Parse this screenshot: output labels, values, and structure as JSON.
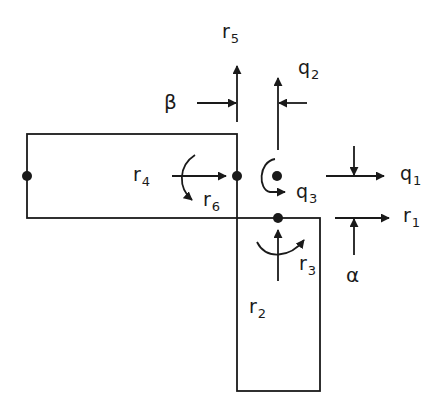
{
  "diagram": {
    "colors": {
      "stroke": "#1a1a1a",
      "background": "#ffffff"
    },
    "labels": {
      "r5": {
        "base": "r",
        "sub": "5"
      },
      "q2": {
        "base": "q",
        "sub": "2"
      },
      "beta": {
        "base": "β"
      },
      "r4": {
        "base": "r",
        "sub": "4"
      },
      "r6": {
        "base": "r",
        "sub": "6"
      },
      "q3": {
        "base": "q",
        "sub": "3"
      },
      "q1": {
        "base": "q",
        "sub": "1"
      },
      "r1": {
        "base": "r",
        "sub": "1"
      },
      "r3": {
        "base": "r",
        "sub": "3"
      },
      "alpha": {
        "base": "α"
      },
      "r2": {
        "base": "r",
        "sub": "2"
      }
    },
    "shapes": {
      "horizontal_member": {
        "x": 27,
        "y": 134,
        "w": 210,
        "h": 84
      },
      "vertical_member": {
        "x": 237,
        "y": 218,
        "w": 83,
        "h": 173
      },
      "nodes": [
        {
          "name": "left-node",
          "x": 27,
          "y": 176
        },
        {
          "name": "joint-node",
          "x": 237,
          "y": 176
        },
        {
          "name": "q-node",
          "x": 277,
          "y": 176
        },
        {
          "name": "bottom-node",
          "x": 278,
          "y": 218
        }
      ]
    }
  }
}
